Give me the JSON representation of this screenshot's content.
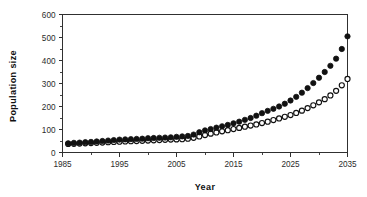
{
  "chart_data": {
    "type": "scatter",
    "title": "",
    "xlabel": "Year",
    "ylabel": "Population size",
    "xlim": [
      1985,
      2035
    ],
    "ylim": [
      0,
      600
    ],
    "xticks": [
      1985,
      1995,
      2005,
      2015,
      2025,
      2035
    ],
    "xtick_labels": [
      "1985",
      "1995",
      "2005",
      "2015",
      "2025",
      "2035"
    ],
    "yticks": [
      0,
      100,
      200,
      300,
      400,
      500,
      600
    ],
    "ytick_labels": [
      "0",
      "100",
      "200",
      "300",
      "400",
      "500",
      "600"
    ],
    "xminor_step": 5,
    "yminor_step": 50,
    "grid": false,
    "legend": "none",
    "x": [
      1986,
      1987,
      1988,
      1989,
      1990,
      1991,
      1992,
      1993,
      1994,
      1995,
      1996,
      1997,
      1998,
      1999,
      2000,
      2001,
      2002,
      2003,
      2004,
      2005,
      2006,
      2007,
      2008,
      2009,
      2010,
      2011,
      2012,
      2013,
      2014,
      2015,
      2016,
      2017,
      2018,
      2019,
      2020,
      2021,
      2022,
      2023,
      2024,
      2025,
      2026,
      2027,
      2028,
      2029,
      2030,
      2031,
      2032,
      2033,
      2034,
      2035
    ],
    "series": [
      {
        "name": "filled-circles",
        "marker": "filled-circle",
        "color": "#111111",
        "values": [
          40,
          42,
          43,
          45,
          46,
          48,
          50,
          52,
          54,
          56,
          57,
          58,
          59,
          60,
          62,
          63,
          64,
          65,
          66,
          68,
          70,
          72,
          78,
          88,
          96,
          102,
          108,
          114,
          120,
          127,
          134,
          142,
          150,
          160,
          171,
          181,
          190,
          200,
          212,
          226,
          242,
          260,
          280,
          302,
          325,
          350,
          377,
          408,
          450,
          505
        ]
      },
      {
        "name": "open-circles",
        "marker": "open-circle",
        "color": "#ffffff",
        "values": [
          37,
          38,
          39,
          40,
          41,
          42,
          43,
          45,
          46,
          47,
          48,
          49,
          50,
          51,
          52,
          53,
          54,
          55,
          56,
          57,
          58,
          60,
          64,
          70,
          76,
          82,
          87,
          92,
          97,
          102,
          107,
          112,
          117,
          122,
          128,
          134,
          141,
          148,
          155,
          163,
          172,
          182,
          193,
          205,
          218,
          232,
          248,
          268,
          292,
          320
        ]
      }
    ]
  }
}
